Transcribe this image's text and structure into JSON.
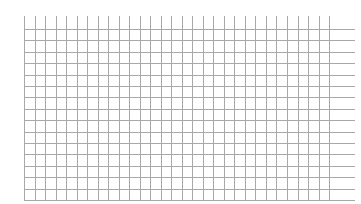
{
  "grid": {
    "background": "#ffffff",
    "line_color": "#a8a8a8",
    "minor_line_color": "#e2e2e2",
    "vertical_lines": {
      "count": 30,
      "x_start": 24,
      "spacing": 10.52,
      "y_top": 16,
      "y_bottom": 201
    },
    "horizontal_lines": {
      "count": 16,
      "y_start": 29,
      "spacing": 11.4,
      "x_left": 24,
      "x_right": 355
    }
  }
}
